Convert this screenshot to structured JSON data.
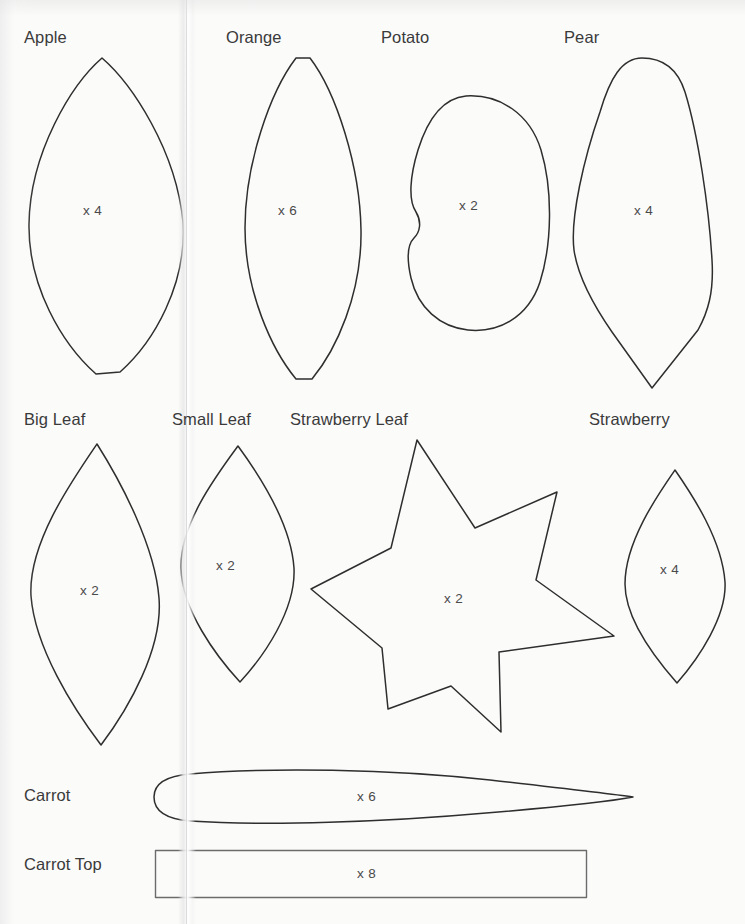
{
  "page": {
    "background_color": "#fbfbfa",
    "ink_color": "#2e2e2e",
    "label_color": "#3a3a3a"
  },
  "rows": [
    {
      "name": "row-1",
      "pieces": [
        {
          "label": "Apple",
          "quantity": "x 4"
        },
        {
          "label": "Orange",
          "quantity": "x 6"
        },
        {
          "label": "Potato",
          "quantity": "x 2"
        },
        {
          "label": "Pear",
          "quantity": "x 4"
        }
      ]
    },
    {
      "name": "row-2",
      "pieces": [
        {
          "label": "Big Leaf",
          "quantity": "x 2"
        },
        {
          "label": "Small Leaf",
          "quantity": "x 2"
        },
        {
          "label": "Strawberry Leaf",
          "quantity": "x 2"
        },
        {
          "label": "Strawberry",
          "quantity": "x 4"
        }
      ]
    },
    {
      "name": "row-3",
      "pieces": [
        {
          "label": "Carrot",
          "quantity": "x 6"
        }
      ]
    },
    {
      "name": "row-4",
      "pieces": [
        {
          "label": "Carrot Top",
          "quantity": "x 8"
        }
      ]
    }
  ],
  "pieces": {
    "apple": {
      "label": "Apple",
      "quantity": "x 4"
    },
    "orange": {
      "label": "Orange",
      "quantity": "x 6"
    },
    "potato": {
      "label": "Potato",
      "quantity": "x 2"
    },
    "pear": {
      "label": "Pear",
      "quantity": "x 4"
    },
    "big_leaf": {
      "label": "Big Leaf",
      "quantity": "x 2"
    },
    "small_leaf": {
      "label": "Small Leaf",
      "quantity": "x 2"
    },
    "strawberry_leaf": {
      "label": "Strawberry Leaf",
      "quantity": "x 2"
    },
    "strawberry": {
      "label": "Strawberry",
      "quantity": "x 4"
    },
    "carrot": {
      "label": "Carrot",
      "quantity": "x 6"
    },
    "carrot_top": {
      "label": "Carrot Top",
      "quantity": "x 8"
    }
  }
}
